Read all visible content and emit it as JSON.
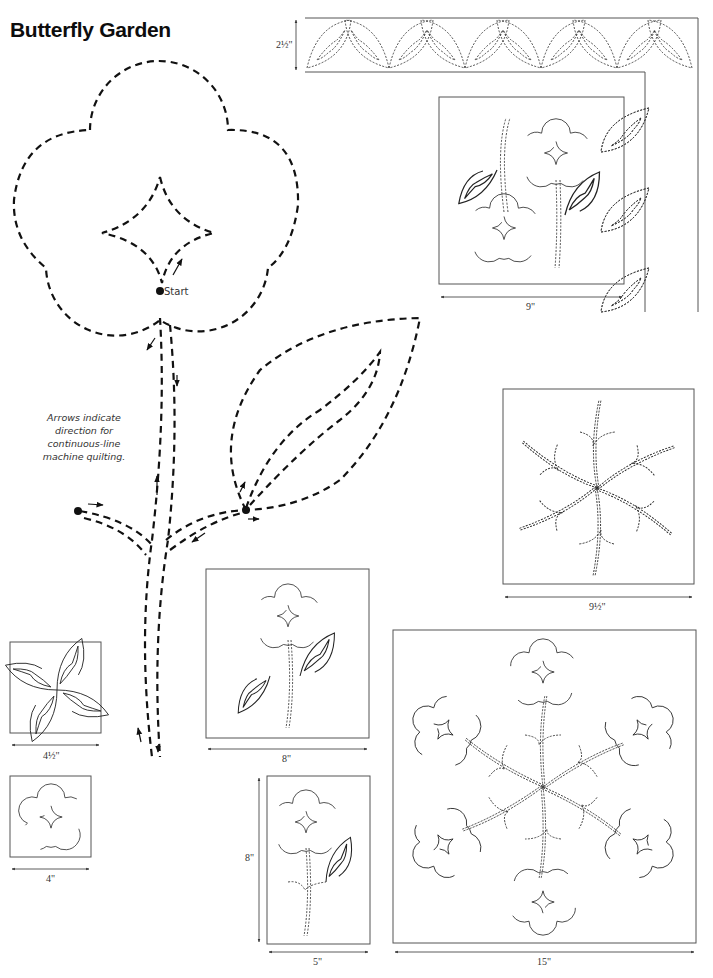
{
  "page": {
    "title": "Butterfly Garden",
    "note": "Arrows indicate direction for continuous-line machine quilting.",
    "start_label": "Start"
  },
  "dimensions": {
    "border_width": "2½\"",
    "block_flowers_pair": "9\"",
    "block_stems_star": "9½\"",
    "block_leaf_x": "4½\"",
    "block_small_flower": "4\"",
    "block_single_flower": "8\"",
    "block_narrow_flower_height": "8\"",
    "block_narrow_flower_width": "5\"",
    "block_medallion": "15\""
  },
  "colors": {
    "line": "#111111",
    "frame": "#555555",
    "background": "#ffffff"
  }
}
